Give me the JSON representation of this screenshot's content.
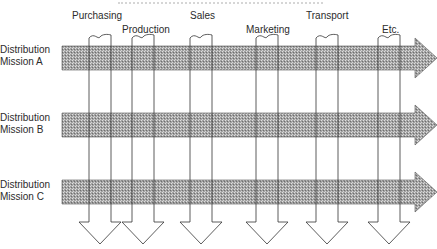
{
  "diagram": {
    "type": "matrix-flow",
    "functions": [
      {
        "label": "Purchasing",
        "x": 89,
        "label_x": 72,
        "label_y": 10
      },
      {
        "label": "Production",
        "x": 132,
        "label_x": 122,
        "label_y": 24
      },
      {
        "label": "Sales",
        "x": 190,
        "label_x": 190,
        "label_y": 10
      },
      {
        "label": "Marketing",
        "x": 256,
        "label_x": 246,
        "label_y": 24
      },
      {
        "label": "Transport",
        "x": 316,
        "label_x": 306,
        "label_y": 10
      },
      {
        "label": "Etc.",
        "x": 378,
        "label_x": 382,
        "label_y": 24
      }
    ],
    "missions": [
      {
        "line1": "Distribution",
        "line2": "Mission A",
        "y": 46,
        "label_y": 44
      },
      {
        "line1": "Distribution",
        "line2": "Mission B",
        "y": 113,
        "label_y": 112
      },
      {
        "line1": "Distribution",
        "line2": "Mission C",
        "y": 180,
        "label_y": 179
      }
    ],
    "colors": {
      "band_fill": "#9a9a9a",
      "band_dot": "#d8d8d8",
      "line": "#333333",
      "background": "#ffffff"
    }
  }
}
